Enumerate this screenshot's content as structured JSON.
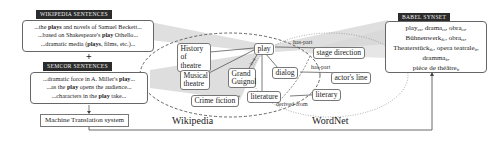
{
  "wikipedia_sentences": {
    "tag": "Wikipedia sentences",
    "lines": [
      {
        "pre": "...the ",
        "bold": "plays",
        "post": " and novels of Samuel Beckett..."
      },
      {
        "pre": "...based on Shakespeare's ",
        "bold": "play",
        "post": " Othello..."
      },
      {
        "pre": "...dramatic media (",
        "bold": "plays",
        "post": ", films, etc.)..."
      }
    ]
  },
  "plus_sign": "+",
  "semcor_sentences": {
    "tag": "SemCor sentences",
    "lines": [
      {
        "pre": "...dramatic force in A. Miller's ",
        "bold": "play",
        "post": "..."
      },
      {
        "pre": "...as the ",
        "bold": "play",
        "post": " opens the audience..."
      },
      {
        "pre": "...characters in the ",
        "bold": "play",
        "post": " take..."
      }
    ]
  },
  "mt_system": {
    "label": "Machine Translation system"
  },
  "graph": {
    "nodes": {
      "play": "play",
      "history_of_theatre": "History of theatre",
      "musical_theatre": "Musical theatre",
      "grand_guignol": "Grand Guignol",
      "dialog": "dialog",
      "crime_fiction": "Crime fiction",
      "literature": "literature",
      "literary": "literary",
      "stage_direction": "stage direction",
      "actors_line": "actor's line"
    },
    "edge_labels": {
      "has_part_1": "has-part",
      "has_part_2": "has-part",
      "derived_from": "derived-from",
      "isa": "is-a"
    },
    "regions": {
      "wikipedia": "Wikipedia",
      "wordnet": "WordNet"
    }
  },
  "babel_synset": {
    "tag": "Babel Synset",
    "entries": [
      {
        "word": "play",
        "lang": "en"
      },
      {
        "word": "drama",
        "lang": "es"
      },
      {
        "word": "obra",
        "lang": "es"
      },
      {
        "word": "Bühnenwerk",
        "lang": "de"
      },
      {
        "word": "obra",
        "lang": "ca"
      },
      {
        "word": "Theaterstück",
        "lang": "de"
      },
      {
        "word": "opera teatrale",
        "lang": "it"
      },
      {
        "word": "dramma",
        "lang": "it"
      },
      {
        "word": "pièce de théâtre",
        "lang": "fr"
      }
    ]
  },
  "colors": {
    "funnel_fill": "#d9d9d9",
    "tag_bg": "#2b2b2b",
    "border": "#666666",
    "dashed_line": "#555555"
  }
}
